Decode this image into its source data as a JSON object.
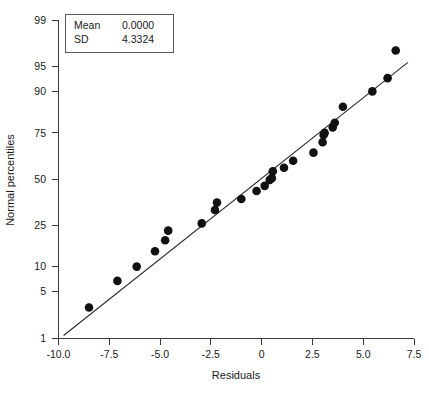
{
  "chart_data": {
    "type": "scatter",
    "title": "",
    "xlabel": "Residuals",
    "ylabel": "Normal percentiles",
    "grid": false,
    "legend_position": "top-left",
    "xlim": [
      -10.0,
      7.5
    ],
    "ylim_percentile": [
      1,
      99
    ],
    "xticks": [
      -10.0,
      -7.5,
      -5.0,
      -2.5,
      0,
      2.5,
      5.0,
      7.5
    ],
    "xtick_labels": [
      "-10.0",
      "-7.5",
      "-5.0",
      "-2.5",
      "0",
      "2.5",
      "5.0",
      "7.5"
    ],
    "yticks": [
      1,
      5,
      10,
      25,
      50,
      75,
      90,
      95,
      99
    ],
    "ytick_labels": [
      "1",
      "5",
      "10",
      "25",
      "50",
      "75",
      "90",
      "95",
      "99"
    ],
    "y_scale": "normal-probability",
    "x": [
      -8.5,
      -7.1,
      -6.15,
      -5.25,
      -4.75,
      -4.6,
      -2.95,
      -2.3,
      -2.2,
      -1.0,
      -0.25,
      0.15,
      0.4,
      0.5,
      0.55,
      1.1,
      1.55,
      2.55,
      3.0,
      3.05,
      3.1,
      3.5,
      3.6,
      4.0,
      5.45,
      6.2,
      6.6
    ],
    "y": [
      3.0,
      6.8,
      10.0,
      14.5,
      18.5,
      22.5,
      25.8,
      32.5,
      36.5,
      38.5,
      43.0,
      46.0,
      49.5,
      50.5,
      54.5,
      56.5,
      60.5,
      65.0,
      70.5,
      74.0,
      75.0,
      77.5,
      79.5,
      85.5,
      90.0,
      93.0,
      97.0
    ],
    "fit_line": {
      "x_start": -9.75,
      "y_start": 1.1,
      "x_end": 7.2,
      "y_end": 95.6
    },
    "annotations": [
      {
        "label": "Mean",
        "value": "0.0000"
      },
      {
        "label": "SD",
        "value": "4.3324"
      }
    ]
  },
  "legend": {
    "mean_label": "Mean",
    "mean_value": "0.0000",
    "sd_label": "SD",
    "sd_value": "4.3324"
  },
  "axes": {
    "x_title": "Residuals",
    "y_title": "Normal percentiles"
  },
  "colors": {
    "point": "#111111",
    "line": "#2a2a2a",
    "axis": "#3a3a3a",
    "text": "#1a1a1a",
    "background": "#ffffff"
  }
}
